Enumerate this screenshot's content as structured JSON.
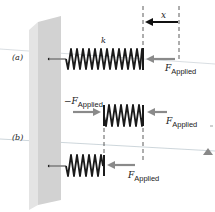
{
  "diagram": {
    "type": "physics-spring-compression",
    "panels": [
      {
        "label": "(a)",
        "spring_constant_label": "k",
        "displacement_label": "x",
        "forces": [
          {
            "symbol": "F",
            "subscript": "Applied",
            "direction": "left",
            "target": "spring free end"
          }
        ]
      },
      {
        "label": "(b)",
        "springs": [
          {
            "position": "upper",
            "forces": [
              {
                "symbol": "−F",
                "subscript": "Applied",
                "direction": "right"
              },
              {
                "symbol": "F",
                "subscript": "Applied",
                "direction": "left"
              }
            ]
          },
          {
            "position": "lower",
            "forces": [
              {
                "symbol": "F",
                "subscript": "Applied",
                "direction": "left"
              }
            ]
          }
        ]
      }
    ],
    "colors": {
      "wall_front": "#d4d4d4",
      "wall_side": "#e6e6e6",
      "spring": "#1a1a1a",
      "force_arrow": "#8a8a8a",
      "guide_line": "#b8c4cc",
      "dashed": "#333333"
    }
  },
  "labels": {
    "panel_a": "(a)",
    "panel_b": "(b)",
    "k": "k",
    "x": "x",
    "f_a": "F",
    "f_a_sub": "Applied",
    "f_b_left": "−F",
    "f_b_left_sub": "Applied",
    "f_b_right": "F",
    "f_b_right_sub": "Applied",
    "f_b_lower": "F",
    "f_b_lower_sub": "Applied"
  }
}
